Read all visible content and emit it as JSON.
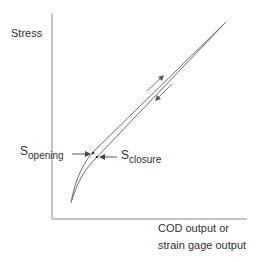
{
  "diagram": {
    "y_axis_label": "Stress",
    "x_axis_label_line1": "COD output or",
    "x_axis_label_line2": "strain gage output",
    "annotations": {
      "opening": {
        "symbol": "S",
        "subscript": "opening"
      },
      "closure": {
        "symbol": "S",
        "subscript": "closure"
      }
    },
    "direction_arrows": [
      "loading-up",
      "unloading-down"
    ],
    "colors": {
      "line": "#6e6e6e",
      "axis": "#8a8a8a",
      "text": "#2f2f2f"
    }
  }
}
